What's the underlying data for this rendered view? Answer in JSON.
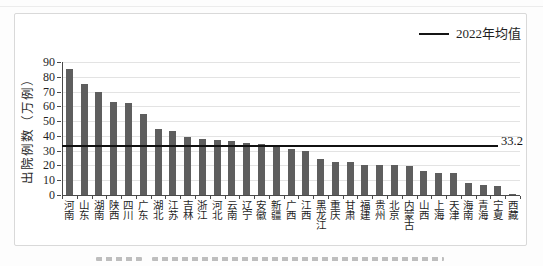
{
  "chart_data": {
    "type": "bar",
    "title": "",
    "xlabel": "",
    "ylabel": "出院例数（万例）",
    "ylim": [
      0,
      90
    ],
    "y_ticks": [
      0,
      10,
      20,
      30,
      40,
      50,
      60,
      70,
      80,
      90
    ],
    "grid": true,
    "legend_position": "top-right",
    "categories": [
      "河南",
      "山东",
      "湖南",
      "陕西",
      "四川",
      "广东",
      "湖北",
      "江苏",
      "吉林",
      "浙江",
      "河北",
      "云南",
      "辽宁",
      "安徽",
      "新疆",
      "广西",
      "江西",
      "黑龙江",
      "重庆",
      "甘肃",
      "福建",
      "贵州",
      "北京",
      "内蒙古",
      "山西",
      "上海",
      "天津",
      "海南",
      "青海",
      "宁夏",
      "西藏"
    ],
    "values": [
      85,
      75,
      70,
      63,
      62,
      55,
      44.5,
      43,
      39,
      38,
      37.5,
      36.5,
      35.5,
      34.5,
      33.5,
      31,
      29.5,
      24.5,
      22.5,
      22,
      20.5,
      20.5,
      20,
      19.5,
      16.5,
      15,
      15,
      8,
      7,
      6,
      1
    ],
    "mean_line": {
      "value": 33.2,
      "annotation": "33.2",
      "legend_label": "2022年均值"
    }
  },
  "colors": {
    "bar": "#5e5e5e",
    "mean_line": "#111111",
    "grid": "#e3e3e3",
    "axis": "#4a4a4a",
    "box_border": "#d9d9d9",
    "text": "#1f1f1f"
  }
}
